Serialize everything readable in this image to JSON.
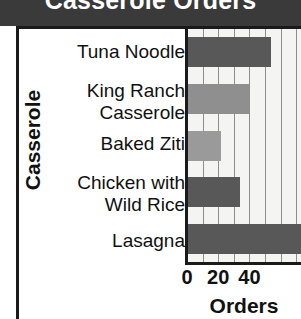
{
  "chart_data": {
    "type": "bar",
    "orientation": "horizontal",
    "title": "Casserole Orders",
    "xlabel": "Orders",
    "ylabel": "Casserole",
    "categories": [
      "Tuna Noodle",
      "King Ranch\nCasserole",
      "Baked Ziti",
      "Chicken with\nWild Rice",
      "Lasagna"
    ],
    "values": [
      54,
      40,
      22,
      34,
      74
    ],
    "xlim": [
      0,
      73
    ],
    "xticks": [
      0,
      20,
      40
    ],
    "xtick_labels": [
      "0",
      "20",
      "40"
    ],
    "gridlines_at": [
      0,
      10,
      20,
      30,
      40,
      50,
      60,
      70
    ],
    "grid": true,
    "legend": "none",
    "bar_colors": [
      "#585858",
      "#8f8f8f",
      "#9a9a9a",
      "#585858",
      "#585858"
    ],
    "plot_background": "#f4f4f2",
    "title_background": "#3a3a3a",
    "title_color": "#ffffff",
    "axis_color": "#1a1a1a",
    "note": "Lasagna bar extends past the right edge of the visible plot area (clipped)"
  }
}
